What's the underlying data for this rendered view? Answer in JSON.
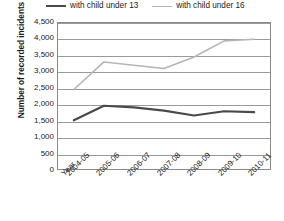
{
  "chart_data": {
    "type": "line",
    "title": "",
    "xlabel": "Year",
    "ylabel": "Number of recorded incidents",
    "categories": [
      "2004-05",
      "2005-06",
      "2006-07",
      "2007-08",
      "2008-09",
      "2009-10",
      "2010-11"
    ],
    "ylim": [
      0,
      4500
    ],
    "ytick_step": 500,
    "yticks": [
      "0",
      "500",
      "1,000",
      "1,500",
      "2,000",
      "2,500",
      "3,000",
      "3,500",
      "4,000",
      "4,500"
    ],
    "ytick_values": [
      0,
      500,
      1000,
      1500,
      2000,
      2500,
      3000,
      3500,
      4000,
      4500
    ],
    "grid": true,
    "legend_position": "top",
    "series": [
      {
        "name": "with child under 13",
        "color": "#4a4a4a",
        "width": 2.2,
        "values": [
          1500,
          1950,
          1900,
          1800,
          1650,
          1780,
          1750
        ]
      },
      {
        "name": "with child under 16",
        "color": "#b5b5b5",
        "width": 1.6,
        "values": [
          2450,
          3300,
          3200,
          3100,
          3450,
          3950,
          4000
        ]
      }
    ]
  },
  "axis": {
    "x_axis_title": "Year"
  },
  "colors": {
    "plot_border": "#8a8a8a",
    "gridline": "#9a9a9a",
    "background": "#ffffff",
    "text": "#1a1a1a"
  }
}
